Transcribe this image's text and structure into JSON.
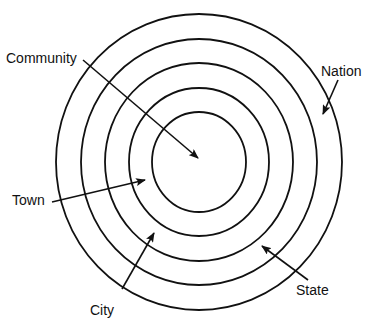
{
  "diagram": {
    "type": "concentric-circles",
    "stroke_color": "#111111",
    "background": "#ffffff",
    "center": {
      "x": 199,
      "y": 162
    },
    "rings": [
      {
        "level": 1,
        "name": "Community",
        "rx": 47,
        "ry": 50
      },
      {
        "level": 2,
        "name": "Town",
        "rx": 70,
        "ry": 74
      },
      {
        "level": 3,
        "name": "City",
        "rx": 94,
        "ry": 99
      },
      {
        "level": 4,
        "name": "State",
        "rx": 118,
        "ry": 123
      },
      {
        "level": 5,
        "name": "Nation",
        "rx": 143,
        "ry": 148
      }
    ],
    "labels": {
      "community": "Community",
      "nation": "Nation",
      "town": "Town",
      "city": "City",
      "state": "State"
    }
  }
}
